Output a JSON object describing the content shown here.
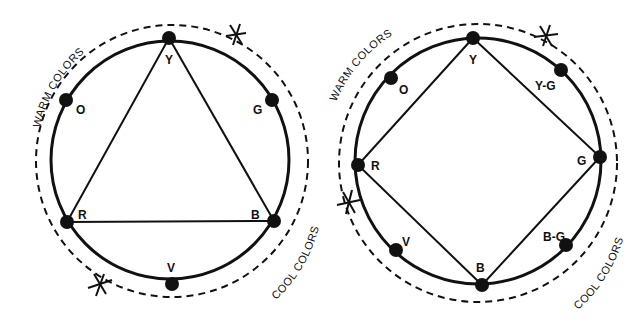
{
  "colors": {
    "ink": "#111111",
    "background": "#ffffff"
  },
  "diagrams": [
    {
      "name": "triad",
      "shape": "triangle",
      "circle": {
        "cx": 170,
        "cy": 160,
        "r": 119
      },
      "dashed_circle": {
        "cx": 172,
        "cy": 161,
        "r": 136
      },
      "polygon_vertices": [
        "Y",
        "B",
        "R"
      ],
      "points": [
        {
          "label": "Y",
          "x": 169,
          "y": 38,
          "lx": 165,
          "ly": 64
        },
        {
          "label": "G",
          "x": 272,
          "y": 100,
          "lx": 253,
          "ly": 114
        },
        {
          "label": "B",
          "x": 274,
          "y": 221,
          "lx": 251,
          "ly": 219
        },
        {
          "label": "V",
          "x": 172,
          "y": 284,
          "lx": 167,
          "ly": 272
        },
        {
          "label": "R",
          "x": 67,
          "y": 222,
          "lx": 78,
          "ly": 219
        },
        {
          "label": "O",
          "x": 66,
          "y": 100,
          "lx": 76,
          "ly": 114
        }
      ],
      "break_marks": [
        {
          "x": 236,
          "y": 34
        },
        {
          "x": 100,
          "y": 284
        }
      ],
      "warm_label": "WARM COLORS",
      "cool_label": "COOL COLORS"
    },
    {
      "name": "tetrad",
      "shape": "square",
      "circle": {
        "cx": 478,
        "cy": 161,
        "r": 123
      },
      "dashed_circle": {
        "cx": 478,
        "cy": 163,
        "r": 139
      },
      "polygon_vertices": [
        "Y",
        "G",
        "B",
        "R"
      ],
      "points": [
        {
          "label": "Y",
          "x": 473,
          "y": 38,
          "lx": 469,
          "ly": 64
        },
        {
          "label": "Y-G",
          "x": 561,
          "y": 70,
          "lx": 535,
          "ly": 90
        },
        {
          "label": "G",
          "x": 600,
          "y": 157,
          "lx": 577,
          "ly": 165
        },
        {
          "label": "B-G",
          "x": 566,
          "y": 245,
          "lx": 543,
          "ly": 241
        },
        {
          "label": "B",
          "x": 482,
          "y": 285,
          "lx": 476,
          "ly": 272
        },
        {
          "label": "V",
          "x": 396,
          "y": 250,
          "lx": 402,
          "ly": 246
        },
        {
          "label": "R",
          "x": 358,
          "y": 165,
          "lx": 371,
          "ly": 170
        },
        {
          "label": "O",
          "x": 391,
          "y": 78,
          "lx": 399,
          "ly": 94
        }
      ],
      "break_marks": [
        {
          "x": 546,
          "y": 36
        },
        {
          "x": 349,
          "y": 203
        }
      ],
      "warm_label": "WARM COLORS",
      "cool_label": "COOL COLORS"
    }
  ]
}
